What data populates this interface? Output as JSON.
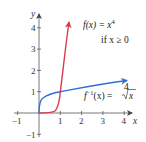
{
  "diagram": {
    "type": "function-graph",
    "axes": {
      "x_label": "x",
      "y_label": "y",
      "x_ticks": [
        "−1",
        "1",
        "2",
        "3",
        "4"
      ],
      "y_ticks": [
        "−1",
        "1",
        "2",
        "3",
        "4"
      ]
    },
    "curves": [
      {
        "name": "f",
        "color": "#d93a4a",
        "label_main": "f(x) = x",
        "label_exp": "4",
        "label_cond": "if x ≥ 0"
      },
      {
        "name": "f-inverse",
        "color": "#2f6fd0",
        "label_f": "f",
        "label_sup": "−1",
        "label_rest": "(x) = ",
        "label_root_index": "4",
        "label_radicand": "x"
      }
    ]
  }
}
